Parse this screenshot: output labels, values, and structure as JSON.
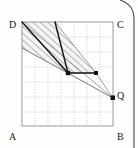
{
  "figure": {
    "canvas": {
      "width": 138,
      "height": 148
    },
    "colors": {
      "background": "#fdfdfc",
      "frame": "#9a9a9a",
      "grid": "#b9b9b9",
      "line_bold": "#1a1a1a",
      "line_thin": "#8a8a8a",
      "hatch": "#6e6e6e",
      "hatch_fill": "#f2f2f0",
      "label": "#1a1a1a",
      "page_edge": "#4a4a4a"
    },
    "square": {
      "name": "ABCD",
      "left": 22,
      "top": 22,
      "right": 113,
      "bottom": 126,
      "grid_cols": 7,
      "grid_rows": 7,
      "grid_style": "dotted"
    },
    "labels": [
      {
        "id": "label-D",
        "text": "D",
        "x": 12,
        "y": 26
      },
      {
        "id": "label-C",
        "text": "C",
        "x": 118,
        "y": 26
      },
      {
        "id": "label-A",
        "text": "A",
        "x": 12,
        "y": 139
      },
      {
        "id": "label-B",
        "text": "B",
        "x": 118,
        "y": 139
      },
      {
        "id": "label-Q",
        "text": "Q",
        "x": 118,
        "y": 96
      }
    ],
    "points": [
      {
        "id": "point-Q",
        "x": 113,
        "y": 98,
        "marked": true
      },
      {
        "id": "point-M",
        "x": 68,
        "y": 73,
        "marked": true
      },
      {
        "id": "point-R",
        "x": 96,
        "y": 73,
        "marked": true
      },
      {
        "id": "point-Ptop",
        "x": 55,
        "y": 22,
        "marked": false
      },
      {
        "id": "point-Dcorner",
        "x": 22,
        "y": 22,
        "marked": false
      }
    ],
    "bold_segments": [
      {
        "id": "seg-D-to-M",
        "x1": 22,
        "y1": 22,
        "x2": 68,
        "y2": 73
      },
      {
        "id": "seg-Ptop-to-M",
        "x1": 55,
        "y1": 22,
        "x2": 68,
        "y2": 73
      },
      {
        "id": "seg-M-to-R",
        "x1": 68,
        "y1": 73,
        "x2": 96,
        "y2": 73
      }
    ],
    "thin_segments": [
      {
        "id": "seg-D-to-Q",
        "x1": 22,
        "y1": 22,
        "x2": 113,
        "y2": 98
      },
      {
        "id": "seg-M-to-Q",
        "x1": 68,
        "y1": 73,
        "x2": 113,
        "y2": 98
      },
      {
        "id": "seg-R-to-Q",
        "x1": 96,
        "y1": 73,
        "x2": 113,
        "y2": 98
      },
      {
        "id": "seg-L-to-Q",
        "x1": 22,
        "y1": 48,
        "x2": 113,
        "y2": 98
      }
    ],
    "shaded_region": {
      "id": "hatched-band",
      "fill": "diagonal-hatch",
      "polygon": "22,22 55,22 96,73 68,73 22,48"
    },
    "page_corner": {
      "id": "page-edge-curve",
      "description": "rounded page corner bracket, top-right"
    }
  }
}
